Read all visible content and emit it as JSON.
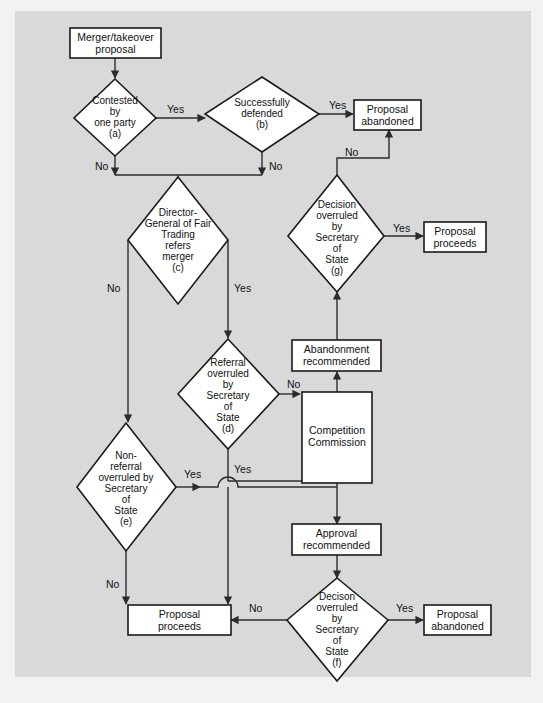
{
  "figure": {
    "background_color": "#d9d9d9",
    "page_color": "#f2f2f2",
    "node_fill": "#ffffff",
    "line_color": "#2b2b2b"
  },
  "nodes": {
    "start": {
      "line1": "Merger/takeover",
      "line2": "proposal"
    },
    "a": {
      "line1": "Contested",
      "line2": "by",
      "line3": "one party",
      "line4": "(a)"
    },
    "b": {
      "line1": "Successfully",
      "line2": "defended",
      "line3": "(b)"
    },
    "abandoned_top": {
      "line1": "Proposal",
      "line2": "abandoned"
    },
    "c": {
      "line1": "Director-",
      "line2": "General of Fair",
      "line3": "Trading",
      "line4": "refers",
      "line5": "merger",
      "line6": "(c)"
    },
    "g": {
      "line1": "Decision",
      "line2": "overruled",
      "line3": "by",
      "line4": "Secretary",
      "line5": "of",
      "line6": "State",
      "line7": "(g)"
    },
    "proceeds_right": {
      "line1": "Proposal",
      "line2": "proceeds"
    },
    "d": {
      "line1": "Referral",
      "line2": "overruled",
      "line3": "by",
      "line4": "Secretary",
      "line5": "of",
      "line6": "State",
      "line7": "(d)"
    },
    "abandonment_rec": {
      "line1": "Abandonment",
      "line2": "recommended"
    },
    "commission": {
      "line1": "Competition",
      "line2": "Commission"
    },
    "e": {
      "line1": "Non-",
      "line2": "referral",
      "line3": "overruled by",
      "line4": "Secretary",
      "line5": "of",
      "line6": "State",
      "line7": "(e)"
    },
    "approval_rec": {
      "line1": "Approval",
      "line2": "recommended"
    },
    "f": {
      "line1": "Decison",
      "line2": "overruled",
      "line3": "by",
      "line4": "Secretary",
      "line5": "of",
      "line6": "State",
      "line7": "(f)"
    },
    "proceeds_bottom": {
      "line1": "Proposal",
      "line2": "proceeds"
    },
    "abandoned_bottom": {
      "line1": "Proposal",
      "line2": "abandoned"
    }
  },
  "edge_labels": {
    "a_yes": "Yes",
    "a_no": "No",
    "b_yes": "Yes",
    "b_no": "No",
    "c_no": "No",
    "c_yes": "Yes",
    "g_no": "No",
    "g_yes": "Yes",
    "d_no": "No",
    "d_yes": "Yes",
    "e_yes": "Yes",
    "e_no": "No",
    "f_no": "No",
    "f_yes": "Yes"
  }
}
